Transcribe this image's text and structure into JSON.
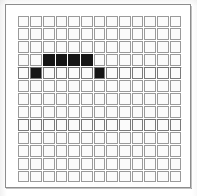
{
  "figure": {
    "background_color": "#ffffff",
    "frame_color": "#8d8d8d",
    "cell_fill_color": "#fbfbfb",
    "cell_border_color": "#9a9a9a",
    "filled_cell_color": "#161616"
  },
  "grid": {
    "rows": 13,
    "columns": 13,
    "cell_size_px": 12.7,
    "origin_x_px": 17,
    "origin_y_px": 15,
    "width_px": 165,
    "height_px": 168,
    "filled_cells": [
      {
        "row": 3,
        "col": 2
      },
      {
        "row": 3,
        "col": 3
      },
      {
        "row": 3,
        "col": 4
      },
      {
        "row": 3,
        "col": 5
      },
      {
        "row": 4,
        "col": 1
      },
      {
        "row": 4,
        "col": 6
      }
    ],
    "heavy_rule_rows": [
      4,
      8
    ],
    "cell_states": [
      [
        "empty",
        "empty",
        "empty",
        "empty",
        "empty",
        "empty",
        "empty",
        "empty",
        "empty",
        "empty",
        "empty",
        "empty",
        "empty"
      ],
      [
        "empty",
        "empty",
        "empty",
        "empty",
        "empty",
        "empty",
        "empty",
        "empty",
        "empty",
        "empty",
        "empty",
        "empty",
        "empty"
      ],
      [
        "empty",
        "empty",
        "empty",
        "empty",
        "empty",
        "empty",
        "empty",
        "empty",
        "empty",
        "empty",
        "empty",
        "empty",
        "empty"
      ],
      [
        "empty",
        "empty",
        "filled",
        "filled",
        "filled",
        "filled",
        "empty",
        "empty",
        "empty",
        "empty",
        "empty",
        "empty",
        "empty"
      ],
      [
        "empty",
        "filled",
        "empty",
        "empty",
        "empty",
        "empty",
        "filled",
        "empty",
        "empty",
        "empty",
        "empty",
        "empty",
        "empty"
      ],
      [
        "empty",
        "empty",
        "empty",
        "empty",
        "empty",
        "empty",
        "empty",
        "empty",
        "empty",
        "empty",
        "empty",
        "empty",
        "empty"
      ],
      [
        "empty",
        "empty",
        "empty",
        "empty",
        "empty",
        "empty",
        "empty",
        "empty",
        "empty",
        "empty",
        "empty",
        "empty",
        "empty"
      ],
      [
        "empty",
        "empty",
        "empty",
        "empty",
        "empty",
        "empty",
        "empty",
        "empty",
        "empty",
        "empty",
        "empty",
        "empty",
        "empty"
      ],
      [
        "empty",
        "empty",
        "empty",
        "empty",
        "empty",
        "empty",
        "empty",
        "empty",
        "empty",
        "empty",
        "empty",
        "empty",
        "empty"
      ],
      [
        "empty",
        "empty",
        "empty",
        "empty",
        "empty",
        "empty",
        "empty",
        "empty",
        "empty",
        "empty",
        "empty",
        "empty",
        "empty"
      ],
      [
        "empty",
        "empty",
        "empty",
        "empty",
        "empty",
        "empty",
        "empty",
        "empty",
        "empty",
        "empty",
        "empty",
        "empty",
        "empty"
      ],
      [
        "empty",
        "empty",
        "empty",
        "empty",
        "empty",
        "empty",
        "empty",
        "empty",
        "empty",
        "empty",
        "empty",
        "empty",
        "empty"
      ],
      [
        "empty",
        "empty",
        "empty",
        "empty",
        "empty",
        "empty",
        "empty",
        "empty",
        "empty",
        "empty",
        "empty",
        "empty",
        "empty"
      ]
    ]
  }
}
